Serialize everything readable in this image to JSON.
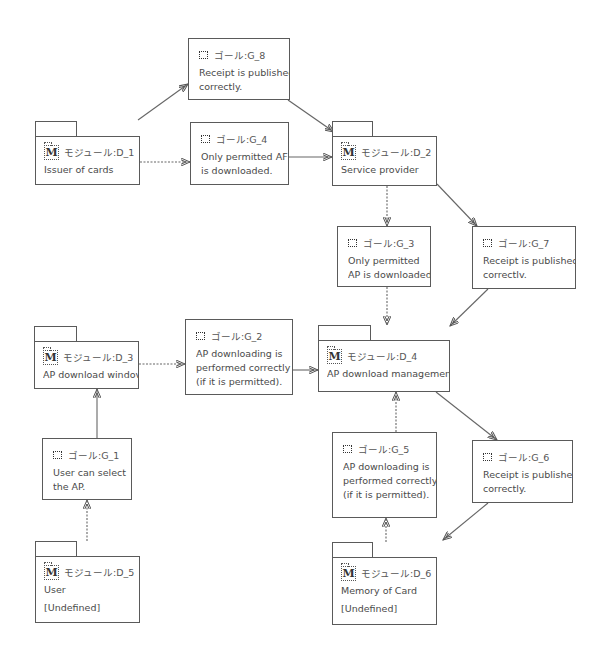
{
  "diagram": {
    "goals": [
      {
        "id": "G_8",
        "label": "ゴール:G_8",
        "text": [
          "Receipt is publishec",
          "correctly."
        ]
      },
      {
        "id": "G_4",
        "label": "ゴール:G_4",
        "text": [
          "Only permitted AF",
          "is downloaded."
        ]
      },
      {
        "id": "G_3",
        "label": "ゴール:G_3",
        "text": [
          "Only permitted",
          "AP is downloaded"
        ]
      },
      {
        "id": "G_7",
        "label": "ゴール:G_7",
        "text": [
          "Receipt is publishec",
          "correctlv."
        ]
      },
      {
        "id": "G_2",
        "label": "ゴール:G_2",
        "text": [
          "AP downloading is",
          "performed correctly",
          "(if it is permitted)."
        ]
      },
      {
        "id": "G_1",
        "label": "ゴール:G_1",
        "text": [
          "User can select",
          "the AP."
        ]
      },
      {
        "id": "G_5",
        "label": "ゴール:G_5",
        "text": [
          "AP downloading is",
          "performed correctly",
          "(if it is permitted)."
        ]
      },
      {
        "id": "G_6",
        "label": "ゴール:G_6",
        "text": [
          "Receipt is publishec",
          "correctly."
        ]
      }
    ],
    "modules": [
      {
        "id": "D_1",
        "label": "モジュール:D_1",
        "text": "Issuer of cards",
        "extra": ""
      },
      {
        "id": "D_2",
        "label": "モジュール:D_2",
        "text": "Service provider",
        "extra": ""
      },
      {
        "id": "D_3",
        "label": "モジュール:D_3",
        "text": "AP download windov",
        "extra": ""
      },
      {
        "id": "D_4",
        "label": "モジュール:D_4",
        "text": "AP download managemen",
        "extra": ""
      },
      {
        "id": "D_5",
        "label": "モジュール:D_5",
        "text": "User",
        "extra": "[Undefined]"
      },
      {
        "id": "D_6",
        "label": "モジュール:D_6",
        "text": "Memory of Card",
        "extra": "[Undefined]"
      }
    ],
    "module_icon_glyph": "M",
    "edges": [
      {
        "from": "D_1",
        "to": "G_8",
        "style": "solid"
      },
      {
        "from": "D_1",
        "to": "G_4",
        "style": "dotted"
      },
      {
        "from": "G_8",
        "to": "D_2",
        "style": "solid"
      },
      {
        "from": "G_4",
        "to": "D_2",
        "style": "solid"
      },
      {
        "from": "D_2",
        "to": "G_3",
        "style": "dotted"
      },
      {
        "from": "D_2",
        "to": "G_7",
        "style": "solid"
      },
      {
        "from": "G_3",
        "to": "D_4",
        "style": "dotted"
      },
      {
        "from": "G_7",
        "to": "D_4",
        "style": "solid"
      },
      {
        "from": "D_3",
        "to": "G_2",
        "style": "dotted"
      },
      {
        "from": "G_2",
        "to": "D_4",
        "style": "solid"
      },
      {
        "from": "G_1",
        "to": "D_3",
        "style": "solid"
      },
      {
        "from": "D_5",
        "to": "G_1",
        "style": "dotted"
      },
      {
        "from": "G_5",
        "to": "D_4",
        "style": "dotted"
      },
      {
        "from": "D_4",
        "to": "G_6",
        "style": "solid"
      },
      {
        "from": "G_6",
        "to": "D_6",
        "style": "solid"
      },
      {
        "from": "D_6",
        "to": "G_5",
        "style": "dotted"
      }
    ]
  }
}
